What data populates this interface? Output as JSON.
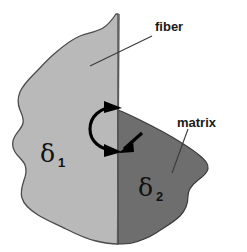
{
  "figure": {
    "background_color": "#ffffff"
  },
  "regions": {
    "fiber": {
      "label": "fiber",
      "symbol": "δ",
      "subscript": "1",
      "fill_color": "#b9b9b9",
      "outline_color": "#4a4a4a"
    },
    "matrix": {
      "label": "matrix",
      "symbol": "δ",
      "subscript": "2",
      "fill_color": "#6e6e6e",
      "outline_color": "#3a3a3a"
    }
  },
  "annotations": {
    "interface_line_color": "#555555",
    "arrow_color": "#000000",
    "leader_color": "#3a3a3a"
  }
}
